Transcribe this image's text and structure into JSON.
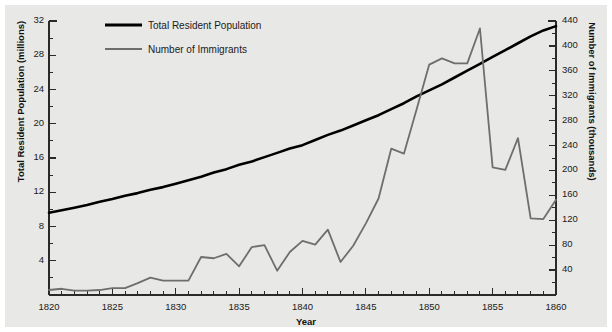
{
  "chart_data": {
    "type": "line",
    "title": "",
    "xlabel": "Year",
    "ylabel": "Total Resident Population (millions)",
    "ylabel_right": "Number of Immigrants (thousands)",
    "xlim": [
      1820,
      1860
    ],
    "xticks": [
      1820,
      1825,
      1830,
      1835,
      1840,
      1845,
      1850,
      1855,
      1860
    ],
    "xtick_labels": [
      "1820",
      "1825",
      "1830",
      "1835",
      "1840",
      "1845",
      "1850",
      "1855",
      "1860"
    ],
    "x_minor_step": 1,
    "ylim_left": [
      0,
      32
    ],
    "yticks_left": [
      4,
      8,
      12,
      16,
      20,
      24,
      28,
      32
    ],
    "ytick_labels_left": [
      "4",
      "8",
      "12",
      "16",
      "20",
      "24",
      "28",
      "32"
    ],
    "y_minor_step_left": 2,
    "ylim_right": [
      0,
      440
    ],
    "yticks_right": [
      40,
      80,
      120,
      160,
      200,
      240,
      280,
      320,
      360,
      400,
      440
    ],
    "ytick_labels_right": [
      "40",
      "80",
      "120",
      "160",
      "200",
      "240",
      "280",
      "320",
      "360",
      "400",
      "440"
    ],
    "y_minor_step_right": 20,
    "grid": false,
    "legend_position": "upper-left-inside",
    "series": [
      {
        "name": "Total Resident Population",
        "axis": "left",
        "units": "millions",
        "color": "#000000",
        "linewidth": 2.6,
        "x": [
          1820,
          1821,
          1822,
          1823,
          1824,
          1825,
          1826,
          1827,
          1828,
          1829,
          1830,
          1831,
          1832,
          1833,
          1834,
          1835,
          1836,
          1837,
          1838,
          1839,
          1840,
          1841,
          1842,
          1843,
          1844,
          1845,
          1846,
          1847,
          1848,
          1849,
          1850,
          1851,
          1852,
          1853,
          1854,
          1855,
          1856,
          1857,
          1858,
          1859,
          1860
        ],
        "values": [
          9.6,
          9.9,
          10.2,
          10.5,
          10.9,
          11.2,
          11.6,
          11.9,
          12.3,
          12.6,
          13.0,
          13.4,
          13.8,
          14.3,
          14.7,
          15.2,
          15.6,
          16.1,
          16.6,
          17.1,
          17.5,
          18.1,
          18.7,
          19.2,
          19.8,
          20.4,
          21.0,
          21.7,
          22.4,
          23.2,
          23.9,
          24.6,
          25.4,
          26.2,
          27.0,
          27.8,
          28.6,
          29.4,
          30.2,
          30.9,
          31.4
        ]
      },
      {
        "name": "Number of Immigrants",
        "axis": "right",
        "units": "thousands",
        "color": "#6e6e6e",
        "linewidth": 1.8,
        "x": [
          1820,
          1821,
          1822,
          1823,
          1824,
          1825,
          1826,
          1827,
          1828,
          1829,
          1830,
          1831,
          1832,
          1833,
          1834,
          1835,
          1836,
          1837,
          1838,
          1839,
          1840,
          1841,
          1842,
          1843,
          1844,
          1845,
          1846,
          1847,
          1848,
          1849,
          1850,
          1851,
          1852,
          1853,
          1854,
          1855,
          1856,
          1857,
          1858,
          1859,
          1860
        ],
        "values": [
          8,
          10,
          7,
          7,
          8,
          11,
          11,
          19,
          28,
          23,
          23,
          23,
          61,
          59,
          66,
          46,
          77,
          80,
          39,
          69,
          87,
          81,
          105,
          53,
          79,
          115,
          155,
          235,
          227,
          298,
          370,
          380,
          372,
          372,
          428,
          205,
          201,
          252,
          123,
          122,
          153
        ]
      }
    ],
    "legend": [
      {
        "label": "Total Resident Population",
        "color": "#000000",
        "linewidth": 3.2
      },
      {
        "label": "Number of Immigrants",
        "color": "#6e6e6e",
        "linewidth": 2.2
      }
    ]
  },
  "colors": {
    "background": "#e8e8e6",
    "page": "#ffffff",
    "axis": "#2a2a2a",
    "population_line": "#000000",
    "immigrant_line": "#6e6e6e",
    "text": "#1a1a1a"
  }
}
